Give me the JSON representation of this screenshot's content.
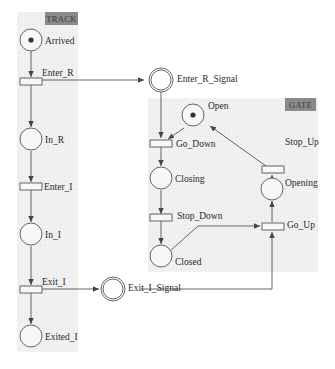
{
  "diagram": {
    "type": "petri-net",
    "groups": [
      {
        "id": "track",
        "label": "TRACK"
      },
      {
        "id": "gate",
        "label": "GATE"
      }
    ],
    "places": {
      "arrived": {
        "label": "Arrived",
        "tokens": 1,
        "group": "TRACK"
      },
      "in_r": {
        "label": "In_R",
        "tokens": 0,
        "group": "TRACK"
      },
      "in_i": {
        "label": "In_I",
        "tokens": 0,
        "group": "TRACK"
      },
      "exited_i": {
        "label": "Exited_I",
        "tokens": 0,
        "group": "TRACK"
      },
      "enter_r_signal": {
        "label": "Enter_R_Signal",
        "tokens": 0,
        "kind": "signal"
      },
      "exit_i_signal": {
        "label": "Exit_I_Signal",
        "tokens": 0,
        "kind": "signal"
      },
      "open": {
        "label": "Open",
        "tokens": 1,
        "group": "GATE"
      },
      "closing": {
        "label": "Closing",
        "tokens": 0,
        "group": "GATE"
      },
      "closed": {
        "label": "Closed",
        "tokens": 0,
        "group": "GATE"
      },
      "opening": {
        "label": "Opening",
        "tokens": 0,
        "group": "GATE"
      }
    },
    "transitions": {
      "enter_r": {
        "label": "Enter_R"
      },
      "enter_i": {
        "label": "Enter_I"
      },
      "exit_i": {
        "label": "Exit_I"
      },
      "go_down": {
        "label": "Go_Down"
      },
      "stop_down": {
        "label": "Stop_Down"
      },
      "go_up": {
        "label": "Go_Up"
      },
      "stop_up": {
        "label": "Stop_Up"
      }
    },
    "arcs": [
      [
        "Arrived",
        "Enter_R"
      ],
      [
        "Enter_R",
        "In_R"
      ],
      [
        "Enter_R",
        "Enter_R_Signal"
      ],
      [
        "In_R",
        "Enter_I"
      ],
      [
        "Enter_I",
        "In_I"
      ],
      [
        "In_I",
        "Exit_I"
      ],
      [
        "Exit_I",
        "Exited_I"
      ],
      [
        "Exit_I",
        "Exit_I_Signal"
      ],
      [
        "Enter_R_Signal",
        "Go_Down"
      ],
      [
        "Open",
        "Go_Down"
      ],
      [
        "Go_Down",
        "Closing"
      ],
      [
        "Closing",
        "Stop_Down"
      ],
      [
        "Stop_Down",
        "Closed"
      ],
      [
        "Closed",
        "Go_Up"
      ],
      [
        "Exit_I_Signal",
        "Go_Up"
      ],
      [
        "Go_Up",
        "Opening"
      ],
      [
        "Opening",
        "Stop_Up"
      ],
      [
        "Stop_Up",
        "Open"
      ]
    ]
  }
}
